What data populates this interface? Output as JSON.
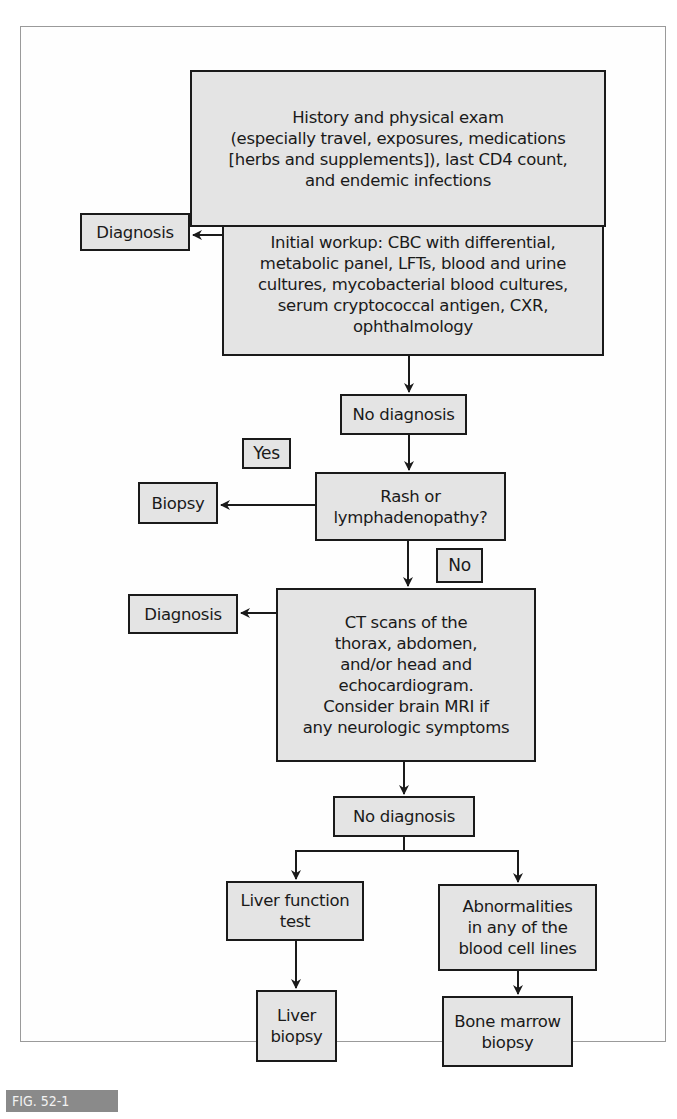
{
  "figure": {
    "label": "FIG. 52-1",
    "colors": {
      "box_fill": "#e4e4e4",
      "box_border": "#1a1a1a",
      "label_bg": "#8a8a8a",
      "frame": "#9a9a9a"
    }
  },
  "nodes": {
    "history": "History and physical exam\n(especially travel, exposures, medications\n[herbs and supplements]), last CD4 count,\nand endemic infections",
    "initial_workup": "Initial workup: CBC with differential,\nmetabolic panel, LFTs, blood and urine\ncultures, mycobacterial blood cultures,\nserum cryptococcal antigen, CXR,\nophthalmology",
    "diagnosis_1": "Diagnosis",
    "no_diagnosis_1": "No diagnosis",
    "rash_question": "Rash or\nlymphadenopathy?",
    "biopsy": "Biopsy",
    "ct_scans": "CT scans of the\nthorax, abdomen,\nand/or head and\nechocardiogram.\nConsider brain MRI if\nany neurologic symptoms",
    "diagnosis_2": "Diagnosis",
    "no_diagnosis_2": "No diagnosis",
    "liver_function_test": "Liver function\ntest",
    "blood_cell_abnormalities": "Abnormalities\nin any of the\nblood cell lines",
    "liver_biopsy": "Liver\nbiopsy",
    "bone_marrow_biopsy": "Bone marrow\nbiopsy"
  },
  "edge_labels": {
    "yes": "Yes",
    "no": "No"
  }
}
